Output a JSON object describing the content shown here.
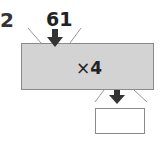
{
  "question": {
    "number": "2"
  },
  "machine": {
    "input": "61",
    "operation_symbol": "×",
    "operation_value": "4",
    "output": ""
  },
  "colors": {
    "machine_fill": "#d3d3d3",
    "border": "#8a8a8a",
    "arrow": "#333333"
  }
}
